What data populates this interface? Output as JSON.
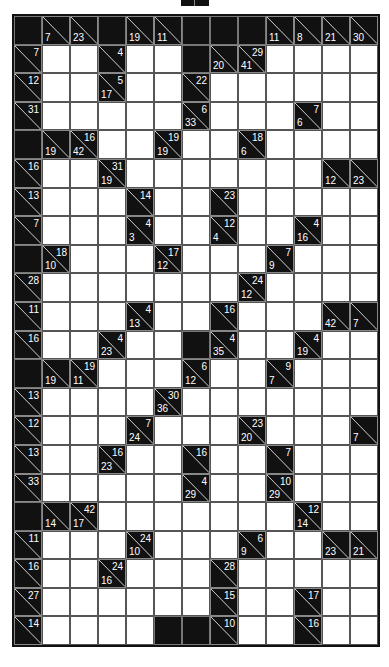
{
  "puzzle": {
    "type": "kakuro",
    "cols": 13,
    "rows": 22,
    "legend": "Cell: B = black block, W = empty white entry cell, {d,r} = clue cell (d = down sum shown bottom-left, r = across sum shown top-right)",
    "grid": [
      [
        "B",
        {
          "d": "7"
        },
        {
          "d": "23"
        },
        "B",
        {
          "d": "19"
        },
        {
          "d": "11"
        },
        "B",
        "B",
        "B",
        {
          "d": "11"
        },
        {
          "d": "8"
        },
        {
          "d": "21"
        },
        {
          "d": "30"
        }
      ],
      [
        {
          "r": "7"
        },
        "W",
        "W",
        {
          "r": "4"
        },
        "W",
        "W",
        "B",
        {
          "d": "20"
        },
        {
          "d": "41",
          "r": "29"
        },
        "W",
        "W",
        "W",
        "W"
      ],
      [
        {
          "r": "12"
        },
        "W",
        "W",
        {
          "d": "17",
          "r": "5"
        },
        "W",
        "W",
        {
          "r": "22"
        },
        "W",
        "W",
        "W",
        "W",
        "W",
        "W"
      ],
      [
        {
          "r": "31"
        },
        "W",
        "W",
        "W",
        "W",
        "W",
        {
          "d": "33",
          "r": "6"
        },
        "W",
        "W",
        "W",
        {
          "d": "6",
          "r": "7"
        },
        "W",
        "W"
      ],
      [
        "B",
        {
          "d": "19"
        },
        {
          "d": "42",
          "r": "16"
        },
        "W",
        "W",
        {
          "d": "19",
          "r": "19"
        },
        "W",
        "W",
        {
          "d": "6",
          "r": "18"
        },
        "W",
        "W",
        "W",
        "W"
      ],
      [
        {
          "r": "16"
        },
        "W",
        "W",
        {
          "d": "19",
          "r": "31"
        },
        "W",
        "W",
        "W",
        "W",
        "W",
        "W",
        "W",
        {
          "d": "12"
        },
        {
          "d": "23"
        }
      ],
      [
        {
          "r": "13"
        },
        "W",
        "W",
        "W",
        {
          "r": "14"
        },
        "W",
        "W",
        {
          "r": "23"
        },
        "W",
        "W",
        "W",
        "W",
        "W"
      ],
      [
        {
          "r": "7"
        },
        "W",
        "W",
        "W",
        {
          "d": "3",
          "r": "4"
        },
        "W",
        "W",
        {
          "d": "4",
          "r": "12"
        },
        "W",
        "W",
        {
          "d": "16",
          "r": "4"
        },
        "W",
        "W"
      ],
      [
        "B",
        {
          "d": "10",
          "r": "18"
        },
        "W",
        "W",
        "W",
        {
          "d": "12",
          "r": "17"
        },
        "W",
        "W",
        "W",
        {
          "d": "9",
          "r": "7"
        },
        "W",
        "W",
        "W"
      ],
      [
        {
          "r": "28"
        },
        "W",
        "W",
        "W",
        "W",
        "W",
        "W",
        "W",
        {
          "d": "12",
          "r": "24"
        },
        "W",
        "W",
        "W",
        "W"
      ],
      [
        {
          "r": "11"
        },
        "W",
        "W",
        "W",
        {
          "d": "13",
          "r": "4"
        },
        "W",
        "W",
        {
          "r": "16"
        },
        "W",
        "W",
        "W",
        {
          "d": "42"
        },
        {
          "d": "7"
        }
      ],
      [
        {
          "r": "16"
        },
        "W",
        "W",
        {
          "d": "23",
          "r": "4"
        },
        "W",
        "W",
        "B",
        {
          "d": "35",
          "r": "4"
        },
        "W",
        "W",
        {
          "d": "19",
          "r": "4"
        },
        "W",
        "W"
      ],
      [
        "B",
        {
          "d": "19"
        },
        {
          "d": "11",
          "r": "19"
        },
        "W",
        "W",
        "W",
        {
          "d": "12",
          "r": "6"
        },
        "W",
        "W",
        {
          "d": "7",
          "r": "9"
        },
        "W",
        "W",
        "W"
      ],
      [
        {
          "r": "13"
        },
        "W",
        "W",
        "W",
        "W",
        {
          "d": "36",
          "r": "30"
        },
        "W",
        "W",
        "W",
        "W",
        "W",
        "W",
        "W"
      ],
      [
        {
          "r": "12"
        },
        "W",
        "W",
        "W",
        {
          "d": "24",
          "r": "7"
        },
        "W",
        "W",
        "W",
        {
          "d": "20",
          "r": "23"
        },
        "W",
        "W",
        "W",
        {
          "d": "7"
        }
      ],
      [
        {
          "r": "13"
        },
        "W",
        "W",
        {
          "d": "23",
          "r": "16"
        },
        "W",
        "W",
        {
          "r": "16"
        },
        "W",
        "W",
        {
          "r": "7"
        },
        "W",
        "W",
        "W"
      ],
      [
        {
          "r": "33"
        },
        "W",
        "W",
        "W",
        "W",
        "W",
        {
          "d": "29",
          "r": "4"
        },
        "W",
        "W",
        {
          "d": "29",
          "r": "10"
        },
        "W",
        "W",
        "W"
      ],
      [
        "B",
        {
          "d": "14"
        },
        {
          "d": "17",
          "r": "42"
        },
        "W",
        "W",
        "W",
        "W",
        "W",
        "W",
        "W",
        {
          "d": "14",
          "r": "12"
        },
        "W",
        "W"
      ],
      [
        {
          "r": "11"
        },
        "W",
        "W",
        "W",
        {
          "d": "10",
          "r": "24"
        },
        "W",
        "W",
        "W",
        {
          "d": "9",
          "r": "6"
        },
        "W",
        "W",
        {
          "d": "23"
        },
        {
          "d": "21"
        }
      ],
      [
        {
          "r": "16"
        },
        "W",
        "W",
        {
          "d": "16",
          "r": "24"
        },
        "W",
        "W",
        "W",
        {
          "r": "28"
        },
        "W",
        "W",
        "W",
        "W",
        "W"
      ],
      [
        {
          "r": "27"
        },
        "W",
        "W",
        "W",
        "W",
        "W",
        "W",
        {
          "r": "15"
        },
        "W",
        "W",
        {
          "r": "17"
        },
        "W",
        "W"
      ],
      [
        {
          "r": "14"
        },
        "W",
        "W",
        "W",
        "W",
        "B",
        "B",
        {
          "r": "10"
        },
        "W",
        "W",
        {
          "r": "16"
        },
        "W",
        "W"
      ]
    ]
  },
  "colors": {
    "block": "#111111",
    "entry": "#ffffff",
    "clue_text": "#ffffff",
    "grid_line": "#555555"
  }
}
